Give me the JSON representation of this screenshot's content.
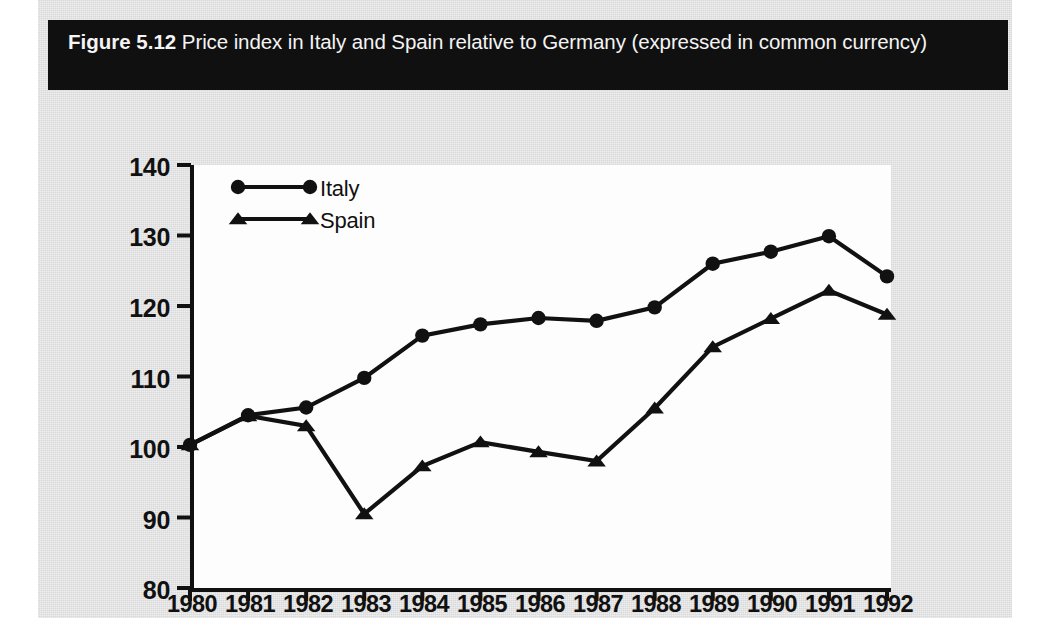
{
  "caption": {
    "figure_number": "Figure 5.12",
    "text": "Price index in Italy and Spain relative to Germany (expressed in common currency)"
  },
  "colors": {
    "series": "#111111",
    "panel_background": "#d9d9d9",
    "plot_background": "#fdfdfd",
    "caption_background": "#101010",
    "caption_text": "#f4f4f4"
  },
  "legend": {
    "position": "inside-top-left",
    "entries": [
      {
        "label": "Italy",
        "marker": "circle-marker"
      },
      {
        "label": "Spain",
        "marker": "triangle-marker"
      }
    ]
  },
  "axes": {
    "y_ticks": [
      "140",
      "130",
      "120",
      "110",
      "100",
      "90",
      "80"
    ],
    "x_ticks": [
      "1980",
      "1981",
      "1982",
      "1983",
      "1984",
      "1985",
      "1986",
      "1987",
      "1988",
      "1989",
      "1990",
      "1991",
      "1992"
    ]
  },
  "chart_data": {
    "type": "line",
    "title": "Price index in Italy and Spain relative to Germany (expressed in common currency)",
    "xlabel": "",
    "ylabel": "",
    "x": [
      1980,
      1981,
      1982,
      1983,
      1984,
      1985,
      1986,
      1987,
      1988,
      1989,
      1990,
      1991,
      1992
    ],
    "xlim": [
      1980,
      1992
    ],
    "ylim": [
      80,
      140
    ],
    "yticks": [
      80,
      90,
      100,
      110,
      120,
      130,
      140
    ],
    "grid": false,
    "legend_position": "upper left inside",
    "series": [
      {
        "name": "Italy",
        "marker": "circle",
        "values": [
          100.3,
          104.5,
          105.6,
          109.8,
          115.8,
          117.4,
          118.3,
          117.9,
          119.8,
          126.0,
          127.7,
          129.9,
          124.2
        ]
      },
      {
        "name": "Spain",
        "marker": "triangle",
        "values": [
          100.3,
          104.4,
          103.0,
          90.5,
          97.3,
          100.7,
          99.3,
          98.0,
          105.5,
          114.2,
          118.2,
          122.2,
          118.8
        ]
      }
    ]
  }
}
